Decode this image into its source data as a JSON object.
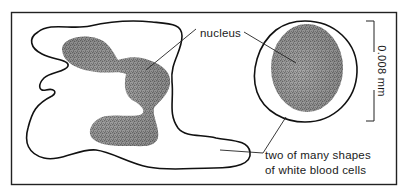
{
  "figure": {
    "title": "Two of many shapes of white blood cells",
    "labels": {
      "nucleus": "nucleus",
      "caption_line1": "two of many shapes",
      "caption_line2": "of white blood cells"
    },
    "scale_bar": {
      "label": "0.008 mm",
      "value": 0.008,
      "unit": "mm"
    },
    "cells": [
      {
        "name": "amoeboid white blood cell",
        "nucleus": "multi-lobed"
      },
      {
        "name": "round white blood cell",
        "nucleus": "single oval"
      }
    ],
    "colors": {
      "ink": "#111111",
      "cytoplasm_stipple": "#9a9a9a",
      "nucleus_stipple": "#3a3a3a",
      "background": "#ffffff"
    }
  }
}
